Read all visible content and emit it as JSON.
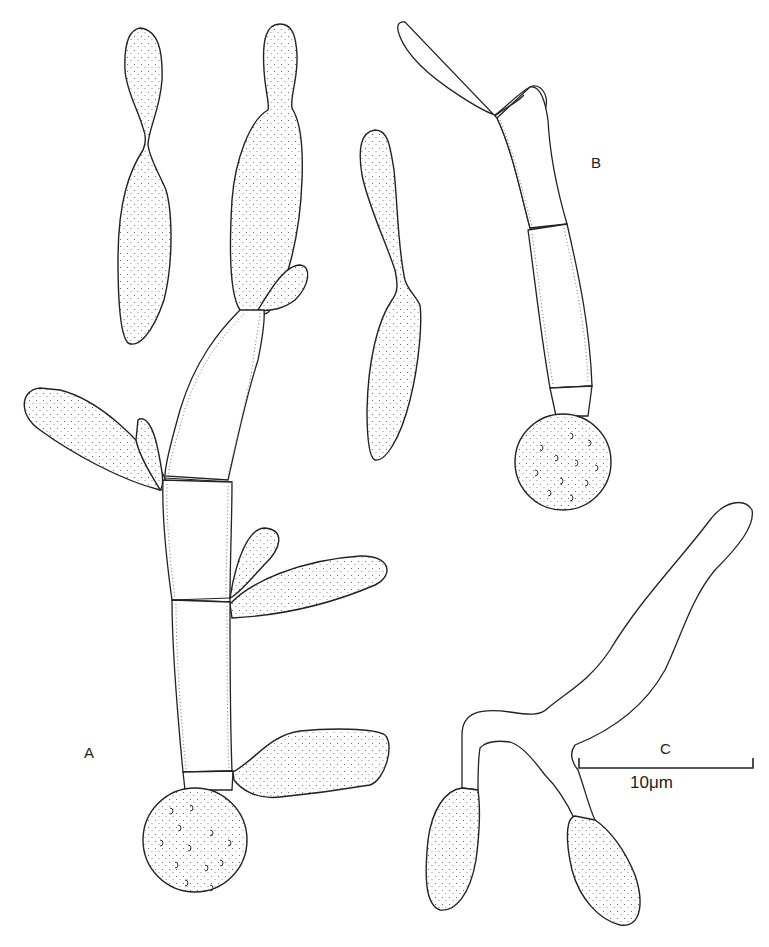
{
  "figure": {
    "panels": [
      {
        "id": "A",
        "label": "A",
        "description": "branched conidiophore with chlamydospore and conidia"
      },
      {
        "id": "B",
        "label": "B",
        "description": "germinating spore with septate hypha"
      },
      {
        "id": "C",
        "label": "C",
        "description": "branched hypha with two swollen conidia"
      }
    ],
    "scale_bar": {
      "panel": "C",
      "label": "10μm",
      "panel_label": "C"
    }
  },
  "colors": {
    "ink": "#222222",
    "paper": "#ffffff",
    "stipple": "#555555"
  }
}
